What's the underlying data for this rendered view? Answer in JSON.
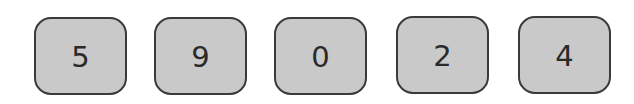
{
  "digits": [
    {
      "value": "5",
      "x": 34,
      "y": 17
    },
    {
      "value": "9",
      "x": 154,
      "y": 17
    },
    {
      "value": "0",
      "x": 274,
      "y": 17
    },
    {
      "value": "2",
      "x": 396,
      "y": 16
    },
    {
      "value": "4",
      "x": 518,
      "y": 16
    }
  ],
  "colors": {
    "box_fill": "#c8c8c8",
    "box_border": "#3a3a3a",
    "digit_text": "#2a2a2a",
    "background": "#ffffff"
  }
}
